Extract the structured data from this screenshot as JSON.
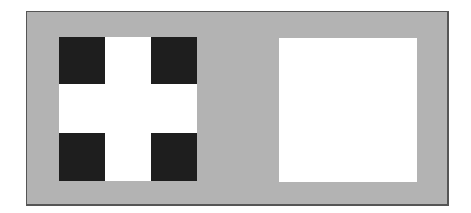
{
  "figure": {
    "background_color": "#b3b3b3",
    "border_color": "#555555",
    "left_panel": {
      "description": "white cross pattern with four dark corner squares",
      "fill_color": "#ffffff",
      "corner_color": "#1e1e1e",
      "corners": [
        "top-left",
        "top-right",
        "bottom-left",
        "bottom-right"
      ]
    },
    "right_panel": {
      "description": "plain white square",
      "fill_color": "#ffffff"
    }
  }
}
